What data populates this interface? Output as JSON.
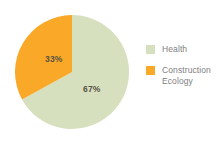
{
  "chart_data": {
    "type": "pie",
    "title": "",
    "categories": [
      "Health",
      "Construction Ecology"
    ],
    "values": [
      67,
      33
    ],
    "data_labels": [
      "67%",
      "33%"
    ],
    "unit": "%",
    "colors": [
      "#D6DFBE",
      "#F9A828"
    ],
    "legend_position": "right",
    "grid": false,
    "start_angle_deg": 0,
    "direction": "clockwise-for-first-slice",
    "background": "#FFFFFF",
    "label_text_color": "#5A5344",
    "legend_text_color": "#808080",
    "slices": [
      {
        "name": "Health",
        "value": 67,
        "label": "67%",
        "color": "#D6DFBE"
      },
      {
        "name": "Construction Ecology",
        "value": 33,
        "label": "33%",
        "color": "#F9A828"
      }
    ]
  },
  "legend": {
    "items": [
      {
        "label": "Health",
        "color": "#D6DFBE",
        "swatch_name": "legend-swatch-health"
      },
      {
        "label": "Construction Ecology",
        "color": "#F9A828",
        "swatch_name": "legend-swatch-construction-ecology"
      }
    ]
  }
}
